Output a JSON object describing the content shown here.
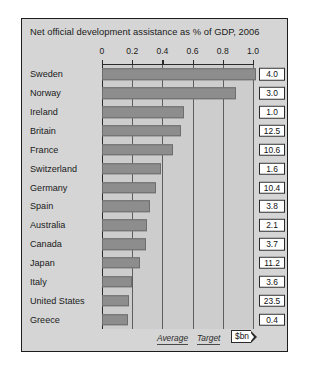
{
  "chart_data": {
    "type": "bar",
    "orientation": "horizontal",
    "title": "Net official development assistance as % of GDP, 2006",
    "xlabel": "",
    "ylabel": "",
    "xlim": [
      0,
      1.08
    ],
    "xticks": [
      0,
      0.2,
      0.4,
      0.6,
      0.8,
      1.0
    ],
    "xtick_labels": [
      "0",
      "0.2",
      "0.4",
      "0.6",
      "0.8",
      "1.0"
    ],
    "grid": true,
    "legend": null,
    "categories": [
      "Sweden",
      "Norway",
      "Ireland",
      "Britain",
      "France",
      "Switzerland",
      "Germany",
      "Spain",
      "Australia",
      "Canada",
      "Japan",
      "Italy",
      "United States",
      "Greece"
    ],
    "values": [
      1.02,
      0.89,
      0.54,
      0.52,
      0.47,
      0.39,
      0.36,
      0.32,
      0.3,
      0.29,
      0.25,
      0.2,
      0.18,
      0.17
    ],
    "secondary_label": "$bn",
    "secondary_values": [
      "4.0",
      "3.0",
      "1.0",
      "12.5",
      "10.6",
      "1.6",
      "10.4",
      "3.8",
      "2.1",
      "3.7",
      "11.2",
      "3.6",
      "23.5",
      "0.4"
    ],
    "annotations": [
      {
        "name": "average",
        "text": "Average"
      },
      {
        "name": "target",
        "text": "Target"
      }
    ],
    "colors": {
      "bar": "#8d8d8d",
      "bar_border": "#6d6d6d",
      "panel_background": "#d5d5d5",
      "plot_background": "#cdcdcd",
      "frame_border": "#1d1d1d",
      "axis": "#2a2a2a",
      "gridline": "#5e5e5e",
      "text": "#1a1a1a",
      "value_box_background": "#ffffff"
    }
  }
}
